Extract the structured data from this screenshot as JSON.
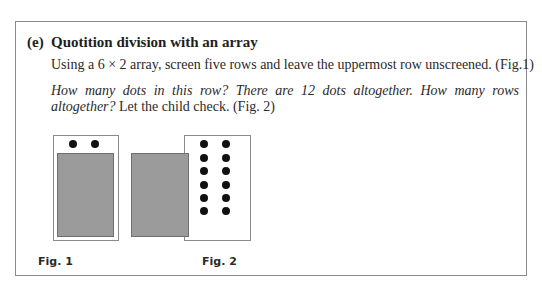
{
  "section": {
    "label": "(e)",
    "title": "Quotition division with an array"
  },
  "paragraphs": {
    "p1": "Using a 6 × 2 array, screen five rows and leave the uppermost row unscreened. (Fig.1)",
    "p2_italic": "How many dots in this row? There are 12 dots altogether. How many rows altogether?",
    "p2_roman": " Let the child check. (Fig. 2)"
  },
  "figures": [
    {
      "label": "Fig. 1",
      "array_rows": 6,
      "array_cols": 2,
      "screened_rows": 5,
      "visible_dots": 2
    },
    {
      "label": "Fig. 2",
      "array_rows": 6,
      "array_cols": 2,
      "screened_rows": 0,
      "visible_dots": 12
    }
  ],
  "colors": {
    "screen_fill": "#9b9b9b",
    "dot": "#111111",
    "border": "#8a8a8a"
  }
}
